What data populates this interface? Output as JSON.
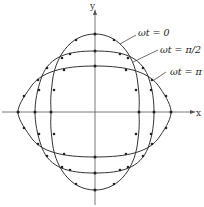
{
  "diagram": {
    "axes": {
      "x_label": "x",
      "y_label": "y"
    },
    "curves": [
      {
        "id": "wt0",
        "label": "ωt = 0",
        "rx": 44,
        "ry_top": 78,
        "ry_bottom": 78,
        "shape": "tall"
      },
      {
        "id": "wtpi2",
        "label": "ωt = π/2",
        "rx": 60,
        "ry": 61,
        "shape": "round"
      },
      {
        "id": "wtpi",
        "label": "ωt = π",
        "rx": 77,
        "ry": 46,
        "shape": "wide"
      }
    ],
    "colors": {
      "line": "#333333",
      "axis": "#555555",
      "dot": "#222222"
    }
  }
}
